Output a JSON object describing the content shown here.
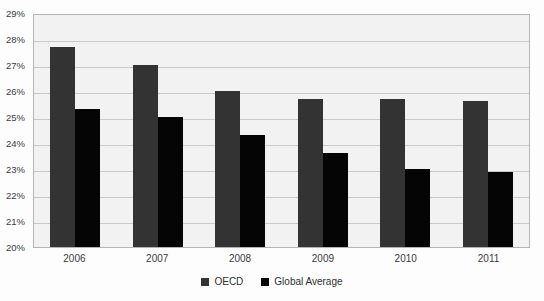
{
  "chart_data": {
    "type": "bar",
    "title": "",
    "xlabel": "",
    "ylabel": "",
    "categories": [
      "2006",
      "2007",
      "2008",
      "2009",
      "2010",
      "2011"
    ],
    "series": [
      {
        "name": "OECD",
        "color": "#333333",
        "values": [
          27.7,
          27.0,
          26.0,
          25.7,
          25.7,
          25.6
        ]
      },
      {
        "name": "Global Average",
        "color": "#050505",
        "values": [
          25.3,
          25.0,
          24.3,
          23.6,
          23.0,
          22.9
        ]
      }
    ],
    "ylim": [
      20,
      29
    ],
    "ytick_labels": [
      "29%",
      "28%",
      "27%",
      "26%",
      "25%",
      "24%",
      "23%",
      "22%",
      "21%",
      "20%"
    ],
    "ytick_values": [
      29,
      28,
      27,
      26,
      25,
      24,
      23,
      22,
      21,
      20
    ],
    "grid": true,
    "legend_position": "bottom",
    "plot_background": "#f2f2f2",
    "grid_color": "#c9c9c9",
    "border_color": "#b4b4b4"
  }
}
